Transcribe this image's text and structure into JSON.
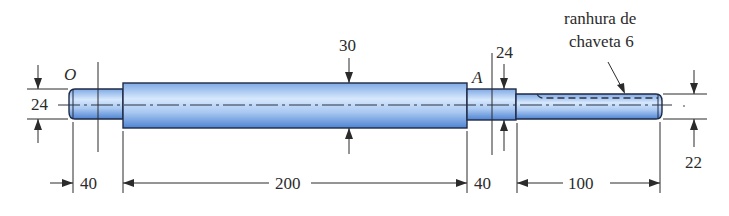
{
  "figure": {
    "labels": {
      "point_o": "O",
      "point_a": "A",
      "keyway_line1": "ranhura de",
      "keyway_line2": "chaveta 6"
    },
    "dimensions": {
      "dia_left": "24",
      "dia_main": "30",
      "dia_a": "24",
      "dia_right": "22",
      "len_left": "40",
      "len_main": "200",
      "len_a": "40",
      "len_right": "100"
    },
    "colors": {
      "shaft_light": "#cfe3fb",
      "shaft_mid": "#8fb8ef",
      "shaft_dark": "#4a7fd0",
      "outline": "#1e2a44",
      "text": "#2b2b2b"
    }
  }
}
